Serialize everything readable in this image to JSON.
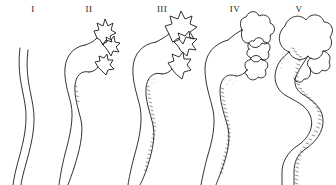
{
  "figure": {
    "background_color": "#ffffff",
    "ink_color": "#1b1b1b",
    "shading_color": "#3a3a3a",
    "style": "line drawing",
    "panel_count": 5
  },
  "panels": [
    {
      "label": "I",
      "name": "grade-1",
      "description": "Normal slender ureter, no dilatation, no visible renal pelvis or calyces",
      "ureter_width": "narrow",
      "calyces": "none",
      "shading": "none",
      "tortuosity": "gentle single curve"
    },
    {
      "label": "II",
      "name": "grade-2",
      "description": "Slight dilatation of ureter with small sharp star-shaped calyces and narrow renal pelvis",
      "ureter_width": "slightly dilated",
      "calyces": "sharp pointed, small",
      "shading": "minimal",
      "tortuosity": "gentle S curve"
    },
    {
      "label": "III",
      "name": "grade-3",
      "description": "Moderate dilatation of ureter and pelvis with blunted enlarged calyces and inner-wall shading",
      "ureter_width": "moderately dilated",
      "calyces": "blunted, enlarged",
      "shading": "hatched inner wall",
      "tortuosity": "S curve"
    },
    {
      "label": "IV",
      "name": "grade-4",
      "description": "Marked dilatation with ballooned rounded calyces and thinned parenchyma",
      "ureter_width": "markedly dilated",
      "calyces": "rounded, ballooned",
      "shading": "hatched inner wall",
      "tortuosity": "S curve"
    },
    {
      "label": "V",
      "name": "grade-5",
      "description": "Gross hydronephrosis with massively dilated tortuous ureter and huge saccular pelvis and calyces",
      "ureter_width": "massively dilated",
      "calyces": "huge saccular",
      "shading": "heavy hatched inner wall",
      "tortuosity": "markedly tortuous serpentine"
    }
  ]
}
